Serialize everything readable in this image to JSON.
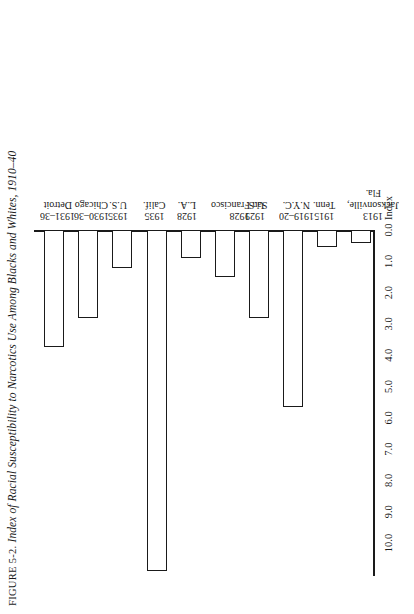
{
  "title": {
    "figure_number": "FIGURE 5-2.",
    "text": "Index of Racial Susceptibility to Narcotics Use Among Blacks and Whites, 1910–40"
  },
  "axis": {
    "index_label": "Index",
    "ticks": [
      "0.0",
      "1.0",
      "2.0",
      "3.0",
      "4.0",
      "5.0",
      "6.0",
      "7.0",
      "8.0",
      "9.0",
      "10.0"
    ]
  },
  "categories": [
    {
      "year": "1913",
      "place": "Jacksonville,",
      "place2": "Fla."
    },
    {
      "year": "1915",
      "place": "Tenn.",
      "place2": ""
    },
    {
      "year": "1919–20",
      "place": "N.Y.C.",
      "place2": ""
    },
    {
      "year": "1929",
      "place": "U.S.",
      "place2": ""
    },
    {
      "year": "1928",
      "place": "San Francisco",
      "place2": ""
    },
    {
      "year": "1928",
      "place": "L.A.",
      "place2": ""
    },
    {
      "year": "1935",
      "place": "Calif.",
      "place2": ""
    },
    {
      "year": "1935",
      "place": "U.S.",
      "place2": ""
    },
    {
      "year": "1930–36",
      "place": "Chicago",
      "place2": ""
    },
    {
      "year": "1931–36",
      "place": "Detroit",
      "place2": ""
    }
  ],
  "chart_data": {
    "type": "bar",
    "orientation": "horizontal",
    "title": "FIGURE 5-2. Index of Racial Susceptibility to Narcotics Use Among Blacks and Whites, 1910–40",
    "xlabel": "Index",
    "ylabel": "",
    "categories": [
      "1913 Jacksonville, Fla.",
      "1915 Tenn.",
      "1919–20 N.Y.C.",
      "1929 U.S.",
      "1928 San Francisco",
      "1928 L.A.",
      "1935 Calif.",
      "1935 U.S.",
      "1930–36 Chicago",
      "1931–36 Detroit"
    ],
    "values": [
      0.4,
      0.55,
      5.65,
      2.8,
      1.5,
      0.9,
      10.9,
      1.2,
      2.8,
      3.75
    ],
    "xlim": [
      0,
      10.5
    ],
    "xticks": [
      0.0,
      1.0,
      2.0,
      3.0,
      4.0,
      5.0,
      6.0,
      7.0,
      8.0,
      9.0,
      10.0
    ],
    "grid": false,
    "legend": "none",
    "bar_fill": "#ffffff",
    "bar_edge": "#1a1a1a"
  }
}
